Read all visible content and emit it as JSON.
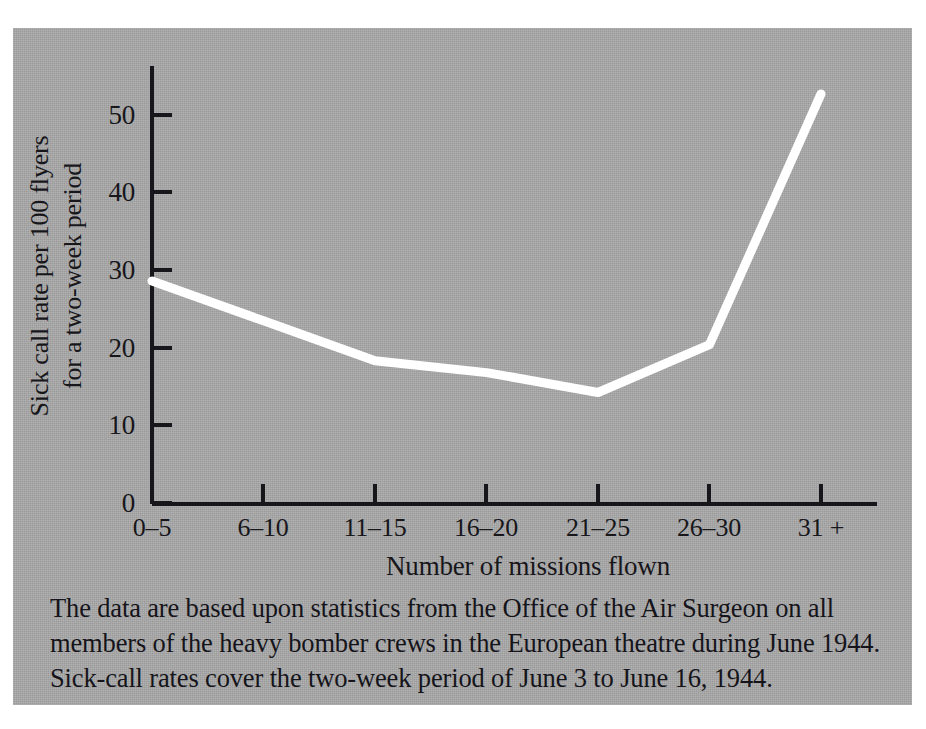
{
  "figure": {
    "background_color": "#ffffff",
    "panel_color": "#a8a8a8",
    "line_color": "#ffffff",
    "axis_color": "#17161a"
  },
  "chart_data": {
    "type": "line",
    "title": "",
    "subtitle": "",
    "xlabel": "Number of missions flown",
    "ylabel": "Sick call rate per 100 flyers for a two-week period",
    "ylabel_lines": [
      "Sick call rate per 100 flyers",
      "for a two-week period"
    ],
    "categories": [
      "0–5",
      "6–10",
      "11–15",
      "16–20",
      "21–25",
      "26–30",
      "31 +"
    ],
    "values": [
      28,
      23,
      18,
      16.5,
      14,
      20,
      51.5
    ],
    "series": [
      {
        "name": "Sick call rate",
        "values": [
          28,
          23,
          18,
          16.5,
          14,
          20,
          51.5
        ]
      }
    ],
    "ylim": [
      0,
      55
    ],
    "yticks": [
      0,
      10,
      20,
      30,
      40,
      50
    ],
    "ytick_labels": [
      "0",
      "10",
      "20",
      "30",
      "40",
      "50"
    ],
    "xtick_labels": [
      "0–5",
      "6–10",
      "11–15",
      "16–20",
      "21–25",
      "26–30",
      "31 +"
    ],
    "grid": false,
    "legend": null,
    "legend_position": "none",
    "annotations": []
  },
  "caption": {
    "lines": [
      "The data are based upon statistics from the Office of the Air Surgeon on all",
      "members of the heavy bomber crews in the European theatre during June 1944.",
      "Sick-call rates cover the two-week period of June 3 to June 16, 1944."
    ]
  }
}
